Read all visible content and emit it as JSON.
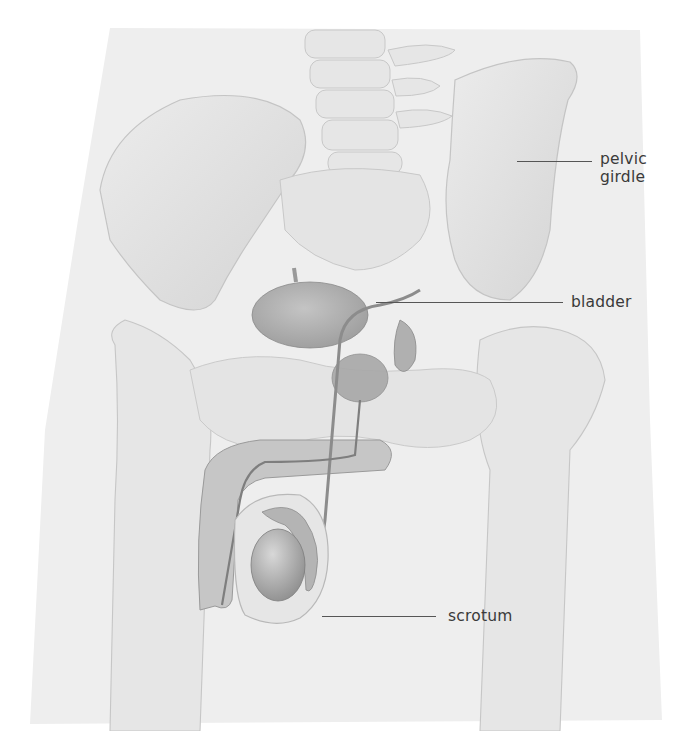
{
  "diagram": {
    "colors": {
      "background": "#ffffff",
      "body_silhouette": "#ececec",
      "bone": "#e2e2e2",
      "bone_shadow": "#c9c9c9",
      "organ": "#b4b4b4",
      "organ_dark": "#999999",
      "label_text": "#3a3a3a",
      "leader_line": "#555555"
    },
    "labels": [
      {
        "id": "pelvic-girdle",
        "text_line1": "pelvic",
        "text_line2": "girdle",
        "text_x": 600,
        "text_y": 150,
        "line_x1": 517,
        "line_x2": 592,
        "line_y": 161
      },
      {
        "id": "bladder",
        "text": "bladder",
        "text_x": 571,
        "text_y": 288,
        "line_x1": 376,
        "line_x2": 563,
        "line_y": 302
      },
      {
        "id": "scrotum",
        "text": "scrotum",
        "text_x": 448,
        "text_y": 603,
        "line_x1": 322,
        "line_x2": 436,
        "line_y": 616
      }
    ]
  }
}
